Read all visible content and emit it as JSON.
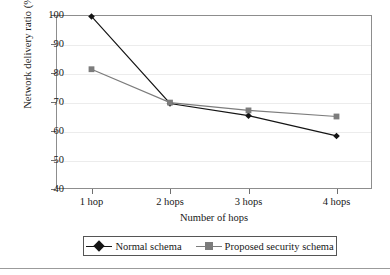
{
  "chart_data": {
    "type": "line",
    "title": "",
    "xlabel": "Number of hops",
    "ylabel": "Network delivery ratio (%)",
    "categories": [
      "1 hop",
      "2 hops",
      "3 hops",
      "4 hops"
    ],
    "xtick_labels": [
      "1 hop",
      "2 hops",
      "3 hops",
      "4 hops"
    ],
    "ytick_labels": [
      "100",
      "90",
      "80",
      "70",
      "60",
      "50",
      "40"
    ],
    "ytick_values": [
      100,
      90,
      80,
      70,
      60,
      50,
      40
    ],
    "ylim": [
      40,
      100
    ],
    "grid": "horizontal",
    "legend_position": "bottom",
    "series": [
      {
        "name": "Normal schema",
        "marker": "diamond",
        "color": "#141414",
        "values": [
          99.5,
          69.5,
          65.3,
          58.3
        ]
      },
      {
        "name": "Proposed security schema",
        "marker": "square",
        "color": "#7c7c7c",
        "values": [
          81.3,
          69.8,
          67.1,
          65.0
        ]
      }
    ]
  },
  "axes": {
    "y_axis_title": "Network delivery ratio (%)",
    "x_axis_title": "Number of hops"
  },
  "legend": {
    "entries": [
      {
        "label": "Normal schema",
        "marker": "diamond-marker",
        "color": "#141414"
      },
      {
        "label": "Proposed security schema",
        "marker": "square-marker",
        "color": "#7c7c7c"
      }
    ]
  },
  "colors": {
    "series_normal": "#141414",
    "series_proposed": "#7c7c7c",
    "frame": "#8d8d8d",
    "grid": "#ececec",
    "text": "#181818"
  }
}
